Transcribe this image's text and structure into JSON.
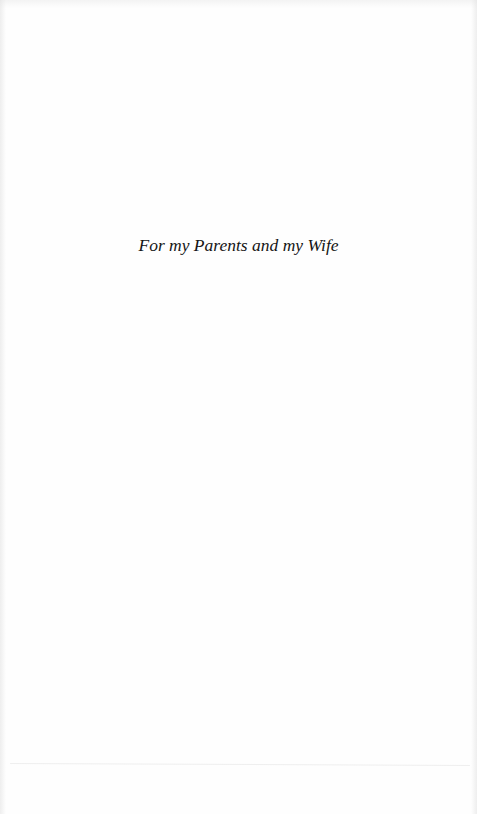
{
  "page": {
    "type": "dedication",
    "dedication_text": "For my Parents and my Wife"
  }
}
